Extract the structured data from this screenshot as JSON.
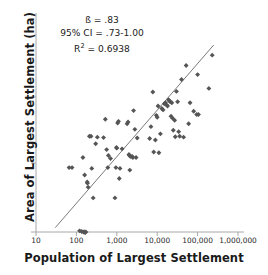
{
  "chart_data": {
    "type": "scatter",
    "title": "",
    "xlabel": "Population of Largest Settlement",
    "ylabel": "Area of Largest Settlement (ha)",
    "xscale": "log",
    "yscale": "log",
    "xlim": [
      10,
      1000000
    ],
    "ylim": [
      0.1,
      1000
    ],
    "grid": false,
    "legend": null,
    "xticklabels": [
      "10",
      "100",
      "1,000",
      "10,000",
      "100,000",
      "1,000,000"
    ],
    "xtickvalues": [
      10,
      100,
      1000,
      10000,
      100000,
      1000000
    ],
    "yticklabels": [
      "",
      "",
      "",
      ""
    ],
    "marker": "diamond",
    "marker_color": "#555555",
    "line_color": "#6a6a6a",
    "axis_color": "#a8a8a8",
    "annotations": {
      "beta_label": "ß = .83",
      "ci_label": "95% CI = .73-1.00",
      "r2_label": "R",
      "r2_sup": "2",
      "r2_value": " = 0.6938",
      "beta": 0.83,
      "ci_low": 0.73,
      "ci_high": 1.0,
      "r_squared": 0.6938
    },
    "fit_line": {
      "x_start": 30,
      "x_end": 250000,
      "y_start": 0.12,
      "y_end": 260
    },
    "points": [
      {
        "x": 66,
        "y": 1.5
      },
      {
        "x": 78,
        "y": 1.5
      },
      {
        "x": 120,
        "y": 0.105
      },
      {
        "x": 135,
        "y": 0.102
      },
      {
        "x": 150,
        "y": 0.1
      },
      {
        "x": 158,
        "y": 0.1
      },
      {
        "x": 165,
        "y": 0.098
      },
      {
        "x": 172,
        "y": 0.1
      },
      {
        "x": 145,
        "y": 2.3
      },
      {
        "x": 160,
        "y": 1.1
      },
      {
        "x": 185,
        "y": 0.82
      },
      {
        "x": 188,
        "y": 0.78
      },
      {
        "x": 195,
        "y": 0.66
      },
      {
        "x": 210,
        "y": 5.6
      },
      {
        "x": 230,
        "y": 5.6
      },
      {
        "x": 240,
        "y": 1.45
      },
      {
        "x": 260,
        "y": 0.42
      },
      {
        "x": 300,
        "y": 4.1
      },
      {
        "x": 330,
        "y": 5.4
      },
      {
        "x": 470,
        "y": 5.3
      },
      {
        "x": 520,
        "y": 11.5
      },
      {
        "x": 560,
        "y": 3.2
      },
      {
        "x": 600,
        "y": 1.5
      },
      {
        "x": 620,
        "y": 2.5
      },
      {
        "x": 700,
        "y": 2.2
      },
      {
        "x": 900,
        "y": 0.42
      },
      {
        "x": 950,
        "y": 1.5
      },
      {
        "x": 980,
        "y": 3.5
      },
      {
        "x": 1000,
        "y": 3.4
      },
      {
        "x": 1050,
        "y": 9.8
      },
      {
        "x": 1100,
        "y": 10.5
      },
      {
        "x": 1150,
        "y": 0.95
      },
      {
        "x": 1200,
        "y": 1.45
      },
      {
        "x": 1350,
        "y": 3.3
      },
      {
        "x": 1800,
        "y": 9.5
      },
      {
        "x": 1900,
        "y": 10.2
      },
      {
        "x": 2000,
        "y": 2.6
      },
      {
        "x": 2050,
        "y": 2.5
      },
      {
        "x": 2100,
        "y": 1.35
      },
      {
        "x": 2200,
        "y": 2.4
      },
      {
        "x": 2400,
        "y": 2.4
      },
      {
        "x": 2500,
        "y": 2.3
      },
      {
        "x": 2600,
        "y": 16.5
      },
      {
        "x": 2800,
        "y": 7.5
      },
      {
        "x": 3000,
        "y": 2.3
      },
      {
        "x": 3200,
        "y": 5.2
      },
      {
        "x": 6500,
        "y": 5.1
      },
      {
        "x": 7000,
        "y": 8.4
      },
      {
        "x": 7800,
        "y": 36
      },
      {
        "x": 8200,
        "y": 2.9
      },
      {
        "x": 9000,
        "y": 4.8
      },
      {
        "x": 9500,
        "y": 13.5
      },
      {
        "x": 10000,
        "y": 12.5
      },
      {
        "x": 10500,
        "y": 20
      },
      {
        "x": 11000,
        "y": 2.8
      },
      {
        "x": 12000,
        "y": 6.2
      },
      {
        "x": 13000,
        "y": 18
      },
      {
        "x": 14000,
        "y": 17
      },
      {
        "x": 15000,
        "y": 22
      },
      {
        "x": 16000,
        "y": 23
      },
      {
        "x": 17000,
        "y": 21
      },
      {
        "x": 18000,
        "y": 20
      },
      {
        "x": 19000,
        "y": 26
      },
      {
        "x": 20000,
        "y": 25
      },
      {
        "x": 21000,
        "y": 24
      },
      {
        "x": 22000,
        "y": 13
      },
      {
        "x": 23000,
        "y": 23
      },
      {
        "x": 24000,
        "y": 12
      },
      {
        "x": 25000,
        "y": 7.2
      },
      {
        "x": 27000,
        "y": 11
      },
      {
        "x": 28000,
        "y": 5.5
      },
      {
        "x": 30000,
        "y": 37
      },
      {
        "x": 32000,
        "y": 24
      },
      {
        "x": 34000,
        "y": 6.8
      },
      {
        "x": 36000,
        "y": 5.6
      },
      {
        "x": 40000,
        "y": 61
      },
      {
        "x": 45000,
        "y": 5.4
      },
      {
        "x": 52000,
        "y": 110
      },
      {
        "x": 60000,
        "y": 9.5
      },
      {
        "x": 65000,
        "y": 23
      },
      {
        "x": 80000,
        "y": 16
      },
      {
        "x": 95000,
        "y": 14
      },
      {
        "x": 100000,
        "y": 75
      },
      {
        "x": 105000,
        "y": 14
      },
      {
        "x": 190000,
        "y": 42
      },
      {
        "x": 230000,
        "y": 170
      }
    ]
  }
}
